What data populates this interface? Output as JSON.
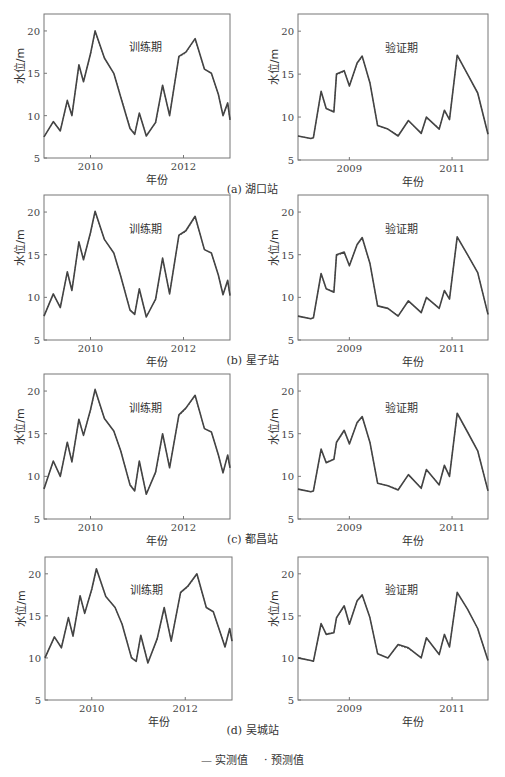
{
  "figure": {
    "ylabel": "水位/m",
    "xlabel": "年份",
    "training_label": "训练期",
    "validation_label": "验证期",
    "legend": {
      "observed": "— 实测值",
      "predicted": "· 预测值"
    },
    "line_color": "#444444"
  },
  "captions": [
    "(a) 湖口站",
    "(b) 星子站",
    "(c) 都昌站",
    "(d) 吴城站"
  ],
  "chart_data": [
    {
      "type": "line",
      "station": "湖口站",
      "period": "训练期",
      "title": "训练期",
      "xlabel": "年份",
      "ylabel": "水位/m",
      "ylim": [
        5,
        22
      ],
      "xlim": [
        2009.0,
        2013.0
      ],
      "xticks": [
        2010,
        2012
      ],
      "yticks": [
        5,
        10,
        15,
        20
      ],
      "x": [
        2009.0,
        2009.2,
        2009.35,
        2009.5,
        2009.6,
        2009.75,
        2009.85,
        2010.0,
        2010.1,
        2010.3,
        2010.5,
        2010.65,
        2010.85,
        2010.95,
        2011.05,
        2011.2,
        2011.4,
        2011.55,
        2011.7,
        2011.9,
        2012.05,
        2012.25,
        2012.45,
        2012.6,
        2012.75,
        2012.85,
        2012.95,
        2013.0
      ],
      "series": [
        {
          "name": "实测值",
          "values": [
            7.5,
            9.3,
            8.2,
            11.8,
            10.0,
            16.0,
            14.0,
            17.3,
            20.0,
            16.8,
            15.0,
            12.2,
            8.5,
            7.8,
            10.3,
            7.6,
            9.2,
            13.6,
            10.0,
            17.0,
            17.5,
            19.1,
            15.5,
            15.0,
            12.5,
            10.0,
            11.5,
            9.5
          ]
        },
        {
          "name": "预测值",
          "values": [
            7.5,
            9.2,
            8.3,
            11.6,
            10.1,
            15.8,
            14.1,
            17.2,
            19.9,
            16.8,
            15.0,
            12.3,
            8.6,
            7.9,
            10.2,
            7.7,
            9.1,
            13.5,
            10.1,
            16.9,
            17.4,
            19.0,
            15.5,
            15.0,
            12.5,
            10.1,
            11.4,
            9.5
          ]
        }
      ]
    },
    {
      "type": "line",
      "station": "湖口站",
      "period": "验证期",
      "title": "验证期",
      "xlabel": "年份",
      "ylabel": "水位/m",
      "ylim": [
        5,
        22
      ],
      "xlim": [
        2008.0,
        2011.7
      ],
      "xticks": [
        2009,
        2011
      ],
      "yticks": [
        5,
        10,
        15,
        20
      ],
      "x": [
        2008.0,
        2008.25,
        2008.3,
        2008.45,
        2008.55,
        2008.7,
        2008.75,
        2008.9,
        2009.0,
        2009.15,
        2009.25,
        2009.4,
        2009.55,
        2009.75,
        2009.95,
        2010.15,
        2010.4,
        2010.5,
        2010.75,
        2010.85,
        2010.95,
        2011.1,
        2011.3,
        2011.5,
        2011.7
      ],
      "series": [
        {
          "name": "实测值",
          "values": [
            7.8,
            7.5,
            7.6,
            13.0,
            11.0,
            10.6,
            15.0,
            15.4,
            13.6,
            16.3,
            17.1,
            14.0,
            9.0,
            8.6,
            7.8,
            9.6,
            8.1,
            10.0,
            8.6,
            10.8,
            9.7,
            17.2,
            15.0,
            12.8,
            8.0
          ]
        },
        {
          "name": "预测值",
          "values": [
            7.8,
            7.5,
            7.6,
            12.9,
            11.0,
            10.7,
            14.9,
            15.3,
            13.7,
            16.2,
            17.0,
            14.0,
            9.0,
            8.6,
            7.9,
            9.5,
            8.2,
            9.9,
            8.7,
            10.7,
            9.8,
            17.1,
            15.0,
            12.8,
            8.0
          ]
        }
      ]
    },
    {
      "type": "line",
      "station": "星子站",
      "period": "训练期",
      "title": "训练期",
      "xlabel": "年份",
      "ylabel": "水位/m",
      "ylim": [
        5,
        22
      ],
      "xlim": [
        2009.0,
        2013.0
      ],
      "xticks": [
        2010,
        2012
      ],
      "yticks": [
        5,
        10,
        15,
        20
      ],
      "x": [
        2009.0,
        2009.2,
        2009.35,
        2009.5,
        2009.6,
        2009.75,
        2009.85,
        2010.0,
        2010.1,
        2010.3,
        2010.5,
        2010.65,
        2010.85,
        2010.95,
        2011.05,
        2011.2,
        2011.4,
        2011.55,
        2011.7,
        2011.9,
        2012.05,
        2012.25,
        2012.45,
        2012.6,
        2012.75,
        2012.85,
        2012.95,
        2013.0
      ],
      "series": [
        {
          "name": "实测值",
          "values": [
            7.8,
            10.4,
            8.8,
            13.0,
            10.8,
            16.5,
            14.4,
            17.6,
            20.1,
            16.8,
            15.2,
            12.5,
            8.5,
            8.0,
            11.0,
            7.7,
            9.8,
            14.6,
            10.4,
            17.3,
            17.8,
            19.5,
            15.6,
            15.2,
            12.6,
            10.3,
            12.0,
            10.2
          ]
        },
        {
          "name": "预测值",
          "values": [
            7.9,
            10.3,
            8.9,
            12.9,
            10.9,
            16.4,
            14.5,
            17.5,
            20.0,
            16.8,
            15.2,
            12.5,
            8.6,
            8.1,
            10.9,
            7.8,
            9.7,
            14.5,
            10.5,
            17.2,
            17.7,
            19.4,
            15.6,
            15.2,
            12.6,
            10.4,
            11.9,
            10.2
          ]
        }
      ]
    },
    {
      "type": "line",
      "station": "星子站",
      "period": "验证期",
      "title": "验证期",
      "xlabel": "年份",
      "ylabel": "水位/m",
      "ylim": [
        5,
        22
      ],
      "xlim": [
        2008.0,
        2011.7
      ],
      "xticks": [
        2009,
        2011
      ],
      "yticks": [
        5,
        10,
        15,
        20
      ],
      "x": [
        2008.0,
        2008.25,
        2008.3,
        2008.45,
        2008.55,
        2008.7,
        2008.75,
        2008.9,
        2009.0,
        2009.15,
        2009.25,
        2009.4,
        2009.55,
        2009.75,
        2009.95,
        2010.15,
        2010.4,
        2010.5,
        2010.75,
        2010.85,
        2010.95,
        2011.1,
        2011.3,
        2011.5,
        2011.7
      ],
      "series": [
        {
          "name": "实测值",
          "values": [
            7.8,
            7.5,
            7.6,
            12.8,
            11.0,
            10.6,
            15.0,
            15.3,
            13.7,
            16.2,
            17.0,
            14.0,
            9.0,
            8.7,
            7.8,
            9.6,
            8.2,
            10.0,
            8.7,
            10.8,
            9.8,
            17.1,
            15.0,
            12.9,
            8.0
          ]
        },
        {
          "name": "预测值",
          "values": [
            7.8,
            7.5,
            7.6,
            12.7,
            11.0,
            10.7,
            14.9,
            15.2,
            13.8,
            16.1,
            16.9,
            14.0,
            9.0,
            8.7,
            7.9,
            9.5,
            8.3,
            9.9,
            8.8,
            10.7,
            9.9,
            17.0,
            15.0,
            12.9,
            8.0
          ]
        }
      ]
    },
    {
      "type": "line",
      "station": "都昌站",
      "period": "训练期",
      "title": "训练期",
      "xlabel": "年份",
      "ylabel": "水位/m",
      "ylim": [
        5,
        22
      ],
      "xlim": [
        2009.0,
        2013.0
      ],
      "xticks": [
        2010,
        2012
      ],
      "yticks": [
        5,
        10,
        15,
        20
      ],
      "x": [
        2009.0,
        2009.2,
        2009.35,
        2009.5,
        2009.6,
        2009.75,
        2009.85,
        2010.0,
        2010.1,
        2010.3,
        2010.5,
        2010.65,
        2010.85,
        2010.95,
        2011.05,
        2011.2,
        2011.4,
        2011.55,
        2011.7,
        2011.9,
        2012.05,
        2012.25,
        2012.45,
        2012.6,
        2012.75,
        2012.85,
        2012.95,
        2013.0
      ],
      "series": [
        {
          "name": "实测值",
          "values": [
            8.5,
            11.8,
            10.0,
            14.0,
            11.7,
            16.7,
            14.8,
            17.8,
            20.2,
            16.8,
            15.3,
            13.0,
            9.0,
            8.3,
            11.8,
            7.9,
            10.5,
            15.0,
            11.0,
            17.2,
            18.0,
            19.5,
            15.6,
            15.2,
            12.5,
            10.4,
            12.5,
            11.0
          ]
        },
        {
          "name": "预测值",
          "values": [
            8.6,
            11.7,
            10.1,
            13.9,
            11.8,
            16.6,
            14.9,
            17.7,
            20.1,
            16.8,
            15.3,
            13.0,
            9.1,
            8.4,
            11.7,
            8.0,
            10.4,
            14.9,
            11.1,
            17.1,
            17.9,
            19.4,
            15.6,
            15.2,
            12.5,
            10.5,
            12.4,
            11.0
          ]
        }
      ]
    },
    {
      "type": "line",
      "station": "都昌站",
      "period": "验证期",
      "title": "验证期",
      "xlabel": "年份",
      "ylabel": "水位/m",
      "ylim": [
        5,
        22
      ],
      "xlim": [
        2008.0,
        2011.7
      ],
      "xticks": [
        2009,
        2011
      ],
      "yticks": [
        5,
        10,
        15,
        20
      ],
      "x": [
        2008.0,
        2008.25,
        2008.3,
        2008.45,
        2008.55,
        2008.7,
        2008.75,
        2008.9,
        2009.0,
        2009.15,
        2009.25,
        2009.4,
        2009.55,
        2009.75,
        2009.95,
        2010.15,
        2010.4,
        2010.5,
        2010.75,
        2010.85,
        2010.95,
        2011.1,
        2011.3,
        2011.5,
        2011.7
      ],
      "series": [
        {
          "name": "实测值",
          "values": [
            8.5,
            8.2,
            8.3,
            13.2,
            11.6,
            12.0,
            14.0,
            15.4,
            13.8,
            16.3,
            17.0,
            14.0,
            9.2,
            8.9,
            8.4,
            10.2,
            8.6,
            10.8,
            9.0,
            11.3,
            10.0,
            17.4,
            15.2,
            13.0,
            8.3
          ]
        },
        {
          "name": "预测值",
          "values": [
            8.5,
            8.2,
            8.3,
            13.1,
            11.7,
            12.0,
            13.9,
            15.3,
            13.9,
            16.2,
            16.9,
            14.0,
            9.2,
            8.9,
            8.5,
            10.1,
            8.7,
            10.7,
            9.1,
            11.2,
            10.1,
            17.3,
            15.2,
            13.0,
            8.3
          ]
        }
      ]
    },
    {
      "type": "line",
      "station": "吴城站",
      "period": "训练期",
      "title": "训练期",
      "xlabel": "年份",
      "ylabel": "水位/m",
      "ylim": [
        5,
        22
      ],
      "xlim": [
        2009.0,
        2013.0
      ],
      "xticks": [
        2010,
        2012
      ],
      "yticks": [
        5,
        10,
        15,
        20
      ],
      "x": [
        2009.0,
        2009.2,
        2009.35,
        2009.5,
        2009.6,
        2009.75,
        2009.85,
        2010.0,
        2010.1,
        2010.3,
        2010.5,
        2010.65,
        2010.85,
        2010.95,
        2011.05,
        2011.2,
        2011.4,
        2011.55,
        2011.7,
        2011.9,
        2012.05,
        2012.25,
        2012.45,
        2012.6,
        2012.75,
        2012.85,
        2012.95,
        2013.0
      ],
      "series": [
        {
          "name": "实测值",
          "values": [
            10.0,
            12.5,
            11.2,
            14.8,
            12.6,
            17.4,
            15.3,
            18.2,
            20.6,
            17.3,
            16.0,
            14.0,
            10.0,
            9.6,
            12.7,
            9.4,
            12.3,
            16.0,
            12.0,
            17.8,
            18.5,
            20.0,
            16.0,
            15.5,
            13.0,
            11.3,
            13.5,
            12.0
          ]
        },
        {
          "name": "预测值",
          "values": [
            10.1,
            12.4,
            11.3,
            14.7,
            12.7,
            17.3,
            15.4,
            18.1,
            20.5,
            17.3,
            16.0,
            14.0,
            10.1,
            9.7,
            12.6,
            9.5,
            12.2,
            15.9,
            12.1,
            17.7,
            18.4,
            19.9,
            16.0,
            15.5,
            13.0,
            11.4,
            13.4,
            12.0
          ]
        }
      ]
    },
    {
      "type": "line",
      "station": "吴城站",
      "period": "验证期",
      "title": "验证期",
      "xlabel": "年份",
      "ylabel": "水位/m",
      "ylim": [
        5,
        22
      ],
      "xlim": [
        2008.0,
        2011.7
      ],
      "xticks": [
        2009,
        2011
      ],
      "yticks": [
        5,
        10,
        15,
        20
      ],
      "x": [
        2008.0,
        2008.25,
        2008.3,
        2008.45,
        2008.55,
        2008.7,
        2008.75,
        2008.9,
        2009.0,
        2009.15,
        2009.25,
        2009.4,
        2009.55,
        2009.75,
        2009.95,
        2010.15,
        2010.4,
        2010.5,
        2010.75,
        2010.85,
        2010.95,
        2011.1,
        2011.3,
        2011.5,
        2011.7
      ],
      "series": [
        {
          "name": "实测值",
          "values": [
            10.0,
            9.7,
            9.6,
            14.1,
            12.8,
            13.0,
            14.8,
            16.2,
            14.0,
            16.8,
            17.5,
            14.8,
            10.5,
            10.0,
            11.6,
            11.2,
            10.0,
            12.4,
            10.4,
            12.8,
            11.3,
            17.8,
            15.8,
            13.5,
            9.7
          ]
        },
        {
          "name": "预测值",
          "values": [
            10.0,
            9.7,
            9.6,
            14.0,
            12.9,
            13.0,
            14.7,
            16.1,
            14.1,
            16.7,
            17.4,
            14.8,
            10.5,
            10.0,
            11.5,
            11.1,
            10.1,
            12.3,
            10.5,
            12.7,
            11.4,
            17.7,
            15.8,
            13.5,
            9.7
          ]
        }
      ]
    }
  ]
}
